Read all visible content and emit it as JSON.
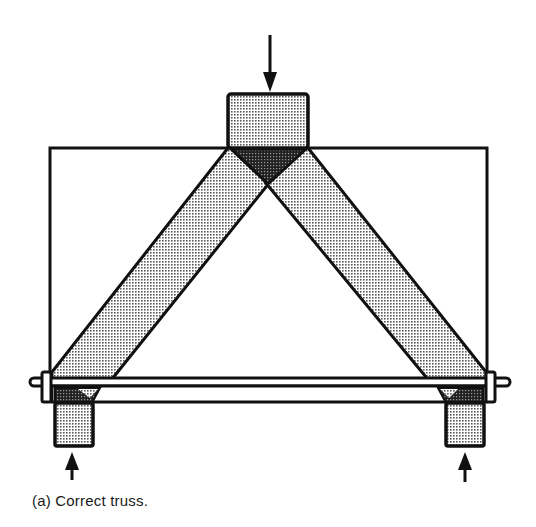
{
  "figure": {
    "caption": "(a)  Correct truss.",
    "subject": "truss",
    "elements": {
      "load_arrow_top": {
        "direction": "down",
        "label": "applied-load"
      },
      "reaction_arrow_left": {
        "direction": "up",
        "label": "left-support-reaction"
      },
      "reaction_arrow_right": {
        "direction": "up",
        "label": "right-support-reaction"
      },
      "top_block": "load-block",
      "left_block": "left-support-block",
      "right_block": "right-support-block",
      "left_strut": "left-diagonal-member",
      "right_strut": "right-diagonal-member",
      "tie_rod": "bottom-tie-rod",
      "frame": "outline-frame"
    },
    "colors": {
      "stroke": "#111111",
      "light_fill": "#d4d4d4",
      "dark_fill": "#3a3a3a",
      "background": "#ffffff"
    }
  }
}
